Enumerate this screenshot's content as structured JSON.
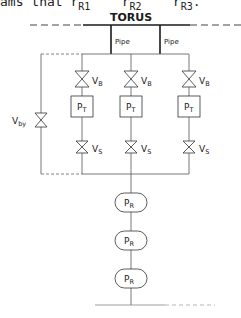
{
  "header_fragment": {
    "prefix": "ams that R",
    "items": [
      {
        "symbol": "R",
        "sub": "R1"
      },
      {
        "symbol": "R",
        "sub": "R2"
      },
      {
        "symbol": "R",
        "sub": "R3"
      }
    ],
    "text": "ams that r",
    "r1": "R1",
    "r2": "R2",
    "r3": "R3"
  },
  "diagram": {
    "title": "TORUS",
    "pipes": [
      {
        "label": "Pipe"
      },
      {
        "label": "Pipe"
      }
    ],
    "branches": [
      {
        "valve_top": {
          "main": "V",
          "sub": "B"
        },
        "pump": {
          "main": "P",
          "sub": "T"
        },
        "valve_bottom": {
          "main": "V",
          "sub": "S"
        }
      },
      {
        "valve_top": {
          "main": "V",
          "sub": "B"
        },
        "pump": {
          "main": "P",
          "sub": "T"
        },
        "valve_bottom": {
          "main": "V",
          "sub": "S"
        }
      },
      {
        "valve_top": {
          "main": "V",
          "sub": "B"
        },
        "pump": {
          "main": "P",
          "sub": "T"
        },
        "valve_bottom": {
          "main": "V",
          "sub": "S"
        }
      }
    ],
    "bypass_valve": {
      "main": "V",
      "sub": "by"
    },
    "roughing_pumps": [
      {
        "main": "P",
        "sub": "R"
      },
      {
        "main": "P",
        "sub": "R"
      },
      {
        "main": "P",
        "sub": "R"
      }
    ],
    "line_color": "#1a1a1a",
    "thin_line_color": "#555555"
  }
}
